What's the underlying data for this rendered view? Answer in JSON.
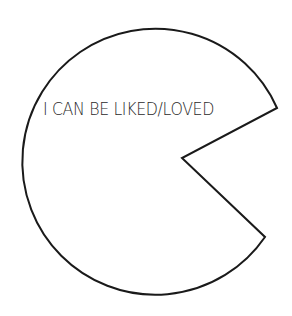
{
  "diagram": {
    "shape": "pac-man circle",
    "label": "I CAN BE LIKED/LOVED",
    "stroke_color": "#1a1a1a",
    "fill_color": "#ffffff",
    "text_color": "#2a2a2a"
  }
}
